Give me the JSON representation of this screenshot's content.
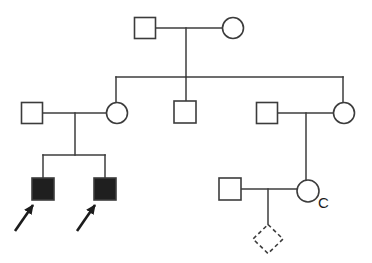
{
  "diagram": {
    "type": "pedigree-chart",
    "canvas": {
      "width": 372,
      "height": 263,
      "background": "#ffffff"
    },
    "style": {
      "line_color": "#3c3c3c",
      "line_width": 1.5,
      "shape_stroke": "#3c3c3c",
      "shape_stroke_width": 1.6,
      "affected_fill": "#1f1f1f",
      "unaffected_fill": "#ffffff",
      "dash_pattern": "4 3",
      "arrow_color": "#1c1c1c",
      "arrow_width": 2.6,
      "label_color": "#1c1c1c"
    },
    "individuals": [
      {
        "id": "I-1",
        "generation": 1,
        "sex": "male",
        "affected": false,
        "shape": "square",
        "cx": 145,
        "cy": 28,
        "size": 21
      },
      {
        "id": "I-2",
        "generation": 1,
        "sex": "female",
        "affected": false,
        "shape": "circle",
        "cx": 233,
        "cy": 28,
        "size": 21
      },
      {
        "id": "II-1",
        "generation": 2,
        "sex": "male",
        "affected": false,
        "shape": "square",
        "cx": 32,
        "cy": 113,
        "size": 21
      },
      {
        "id": "II-2",
        "generation": 2,
        "sex": "female",
        "affected": false,
        "shape": "circle",
        "cx": 117,
        "cy": 113,
        "size": 21
      },
      {
        "id": "II-3",
        "generation": 2,
        "sex": "male",
        "affected": false,
        "shape": "square",
        "cx": 185,
        "cy": 112,
        "size": 22
      },
      {
        "id": "II-4",
        "generation": 2,
        "sex": "male",
        "affected": false,
        "shape": "square",
        "cx": 267,
        "cy": 113,
        "size": 21
      },
      {
        "id": "II-5",
        "generation": 2,
        "sex": "female",
        "affected": false,
        "shape": "circle",
        "cx": 344,
        "cy": 113,
        "size": 21
      },
      {
        "id": "III-1",
        "generation": 3,
        "sex": "male",
        "affected": true,
        "shape": "square",
        "cx": 43,
        "cy": 189,
        "size": 22
      },
      {
        "id": "III-2",
        "generation": 3,
        "sex": "male",
        "affected": true,
        "shape": "square",
        "cx": 105,
        "cy": 189,
        "size": 22
      },
      {
        "id": "III-3",
        "generation": 3,
        "sex": "male",
        "affected": false,
        "shape": "square",
        "cx": 230,
        "cy": 189,
        "size": 22
      },
      {
        "id": "III-4",
        "generation": 3,
        "sex": "female",
        "affected": false,
        "shape": "circle",
        "cx": 308,
        "cy": 191,
        "size": 22
      },
      {
        "id": "IV-1",
        "generation": 4,
        "sex": "unknown",
        "affected": false,
        "shape": "diamond",
        "cx": 268,
        "cy": 239,
        "w": 15,
        "h": 14.5,
        "dashed": true
      }
    ],
    "lines": [
      {
        "name": "gen1-marriage-line",
        "x1": 156,
        "y1": 28,
        "x2": 222,
        "y2": 28
      },
      {
        "name": "gen1-descent-line",
        "x1": 186,
        "y1": 28,
        "x2": 186,
        "y2": 77
      },
      {
        "name": "gen2-sibship-line",
        "x1": 116,
        "y1": 77,
        "x2": 343,
        "y2": 77
      },
      {
        "name": "gen2-drop-to-II-2",
        "x1": 116,
        "y1": 77,
        "x2": 116,
        "y2": 103
      },
      {
        "name": "gen2-drop-to-II-3",
        "x1": 186,
        "y1": 77,
        "x2": 186,
        "y2": 101
      },
      {
        "name": "gen2-drop-to-II-5",
        "x1": 343,
        "y1": 77,
        "x2": 343,
        "y2": 103
      },
      {
        "name": "gen2-left-marriage-line",
        "x1": 43,
        "y1": 113,
        "x2": 106,
        "y2": 113
      },
      {
        "name": "gen2-left-descent-line",
        "x1": 75,
        "y1": 113,
        "x2": 75,
        "y2": 155
      },
      {
        "name": "gen3-left-sibship-line",
        "x1": 43,
        "y1": 155,
        "x2": 105,
        "y2": 155
      },
      {
        "name": "gen3-drop-to-III-1",
        "x1": 43,
        "y1": 155,
        "x2": 43,
        "y2": 178
      },
      {
        "name": "gen3-drop-to-III-2",
        "x1": 105,
        "y1": 155,
        "x2": 105,
        "y2": 178
      },
      {
        "name": "gen2-right-marriage-line",
        "x1": 278,
        "y1": 113,
        "x2": 333,
        "y2": 113
      },
      {
        "name": "gen2-right-descent-line",
        "x1": 306,
        "y1": 113,
        "x2": 306,
        "y2": 180
      },
      {
        "name": "gen3-right-marriage-line",
        "x1": 241,
        "y1": 189,
        "x2": 297,
        "y2": 189
      },
      {
        "name": "gen3-right-descent-line",
        "x1": 268,
        "y1": 189,
        "x2": 268,
        "y2": 225
      }
    ],
    "arrows": [
      {
        "name": "proband-arrow-III-1",
        "x1": 15,
        "y1": 231,
        "x2": 33,
        "y2": 205
      },
      {
        "name": "proband-arrow-III-2",
        "x1": 77,
        "y1": 231,
        "x2": 95,
        "y2": 205
      }
    ],
    "labels": [
      {
        "name": "label-C",
        "text": "C",
        "x": 318,
        "y": 208,
        "font_size": 15
      }
    ]
  }
}
